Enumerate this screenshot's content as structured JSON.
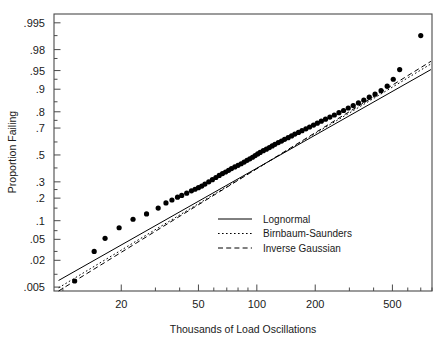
{
  "chart_data": {
    "type": "scatter",
    "title": "",
    "xlabel": "Thousands of Load Oscillations",
    "ylabel": "Proportion Failing",
    "xscale": "log",
    "yscale": "probability-lognormal",
    "grid": false,
    "xlim": [
      9,
      800
    ],
    "ylim": [
      0.004,
      0.997
    ],
    "xticks": [
      20,
      50,
      100,
      200,
      500
    ],
    "xtick_labels": [
      "20",
      "50",
      "100",
      "200",
      "500"
    ],
    "yticks": [
      0.005,
      0.02,
      0.05,
      0.1,
      0.2,
      0.3,
      0.5,
      0.7,
      0.8,
      0.9,
      0.95,
      0.98,
      0.995
    ],
    "ytick_labels": [
      ".005",
      ".02",
      ".05",
      ".1",
      ".2",
      ".3",
      ".5",
      ".7",
      ".8",
      ".9",
      ".95",
      ".98",
      ".995"
    ],
    "legend_position": "center-right",
    "marker": "filled-circle",
    "marker_color": "#000000",
    "series": [
      {
        "name": "Data",
        "type": "scatter",
        "points": [
          [
            11.5,
            0.007
          ],
          [
            14.5,
            0.03
          ],
          [
            16.5,
            0.052
          ],
          [
            19.5,
            0.078
          ],
          [
            23.0,
            0.105
          ],
          [
            27.0,
            0.125
          ],
          [
            31.0,
            0.15
          ],
          [
            34.0,
            0.175
          ],
          [
            36.5,
            0.19
          ],
          [
            39.0,
            0.205
          ],
          [
            41.0,
            0.215
          ],
          [
            43.5,
            0.228
          ],
          [
            46.0,
            0.242
          ],
          [
            48.0,
            0.252
          ],
          [
            50.0,
            0.262
          ],
          [
            52.0,
            0.272
          ],
          [
            54.0,
            0.285
          ],
          [
            56.5,
            0.3
          ],
          [
            59.0,
            0.315
          ],
          [
            61.5,
            0.33
          ],
          [
            64.0,
            0.345
          ],
          [
            66.5,
            0.358
          ],
          [
            69.0,
            0.37
          ],
          [
            71.5,
            0.382
          ],
          [
            74.0,
            0.395
          ],
          [
            77.0,
            0.408
          ],
          [
            80.0,
            0.42
          ],
          [
            83.0,
            0.432
          ],
          [
            86.0,
            0.445
          ],
          [
            89.0,
            0.458
          ],
          [
            92.0,
            0.47
          ],
          [
            95.0,
            0.482
          ],
          [
            98.0,
            0.495
          ],
          [
            101.0,
            0.508
          ],
          [
            104.0,
            0.52
          ],
          [
            108.0,
            0.533
          ],
          [
            112.0,
            0.545
          ],
          [
            116.0,
            0.557
          ],
          [
            120.0,
            0.57
          ],
          [
            124.0,
            0.582
          ],
          [
            129.0,
            0.595
          ],
          [
            134.0,
            0.607
          ],
          [
            139.0,
            0.62
          ],
          [
            145.0,
            0.632
          ],
          [
            151.0,
            0.645
          ],
          [
            157.0,
            0.658
          ],
          [
            164.0,
            0.67
          ],
          [
            171.0,
            0.682
          ],
          [
            179.0,
            0.695
          ],
          [
            187.0,
            0.707
          ],
          [
            196.0,
            0.72
          ],
          [
            205.0,
            0.732
          ],
          [
            215.0,
            0.745
          ],
          [
            226.0,
            0.757
          ],
          [
            238.0,
            0.77
          ],
          [
            251.0,
            0.782
          ],
          [
            265.0,
            0.795
          ],
          [
            280.0,
            0.807
          ],
          [
            296.0,
            0.82
          ],
          [
            314.0,
            0.832
          ],
          [
            334.0,
            0.845
          ],
          [
            356.0,
            0.857
          ],
          [
            380.0,
            0.87
          ],
          [
            407.0,
            0.882
          ],
          [
            437.0,
            0.895
          ],
          [
            470.0,
            0.91
          ],
          [
            505.0,
            0.93
          ],
          [
            545.0,
            0.952
          ],
          [
            700.0,
            0.99
          ]
        ]
      },
      {
        "name": "Lognormal",
        "type": "line",
        "style": "solid",
        "endpoints": [
          [
            9.5,
            0.0072
          ],
          [
            790.0,
            0.952
          ]
        ]
      },
      {
        "name": "Birnbaum-Saunders",
        "type": "line",
        "style": "dotted",
        "endpoints": [
          [
            9.5,
            0.0048
          ],
          [
            790.0,
            0.962
          ]
        ]
      },
      {
        "name": "Inverse Gaussian",
        "type": "line",
        "style": "dashed",
        "endpoints": [
          [
            9.5,
            0.004
          ],
          [
            790.0,
            0.966
          ]
        ]
      }
    ],
    "legend": [
      {
        "label": "Lognormal",
        "style": "solid"
      },
      {
        "label": "Birnbaum-Saunders",
        "style": "dotted"
      },
      {
        "label": "Inverse Gaussian",
        "style": "dashed"
      }
    ]
  }
}
